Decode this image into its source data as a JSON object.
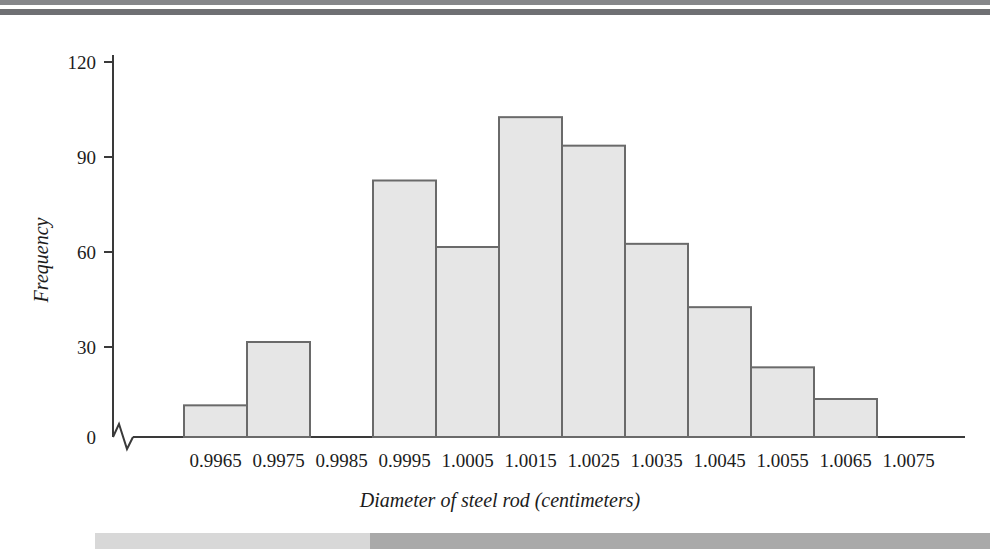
{
  "figure": {
    "background_color": "#ffffff",
    "bar_fill_color": "#e6e6e6",
    "bar_stroke_color": "#6a6a6a",
    "axis_color": "#3a3a3a",
    "top_rule_color_1": "#86878a",
    "top_rule_color_2": "#6f7073",
    "bottom_band_light_color": "#d8d8d8",
    "bottom_band_dark_color": "#a9a9a9"
  },
  "chart_data": {
    "type": "bar",
    "title": "",
    "xlabel": "Diameter of steel rod (centimeters)",
    "ylabel": "Frequency",
    "categories": [
      "0.9965",
      "0.9975",
      "0.9985",
      "0.9995",
      "1.0005",
      "1.0015",
      "1.0025",
      "1.0035",
      "1.0045",
      "1.0055",
      "1.0065",
      "1.0075"
    ],
    "values": [
      10,
      30,
      0,
      81,
      60,
      101,
      92,
      61,
      41,
      22,
      12,
      0
    ],
    "ytick_labels": [
      "0",
      "30",
      "60",
      "90",
      "120"
    ],
    "ytick_values": [
      0,
      30,
      60,
      90,
      120
    ],
    "ylim": [
      0,
      126
    ],
    "grid": false,
    "legend": false,
    "axis_break": "x-axis has a zigzag break mark near the origin"
  }
}
